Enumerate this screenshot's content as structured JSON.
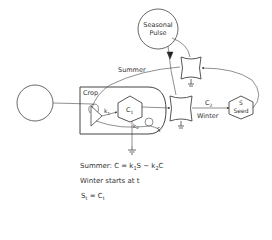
{
  "diagram": {
    "type": "energy-systems-diagram",
    "nodes": {
      "source_left": {
        "shape": "circle",
        "label": ""
      },
      "seasonal_pulse": {
        "shape": "circle",
        "label_line1": "Seasonal",
        "label_line2": "Pulse"
      },
      "crop_box": {
        "shape": "rounded-box",
        "label": "Crop"
      },
      "k1": {
        "shape": "production-triangle",
        "label": "k",
        "sub": "1"
      },
      "c1": {
        "shape": "hexagon-storage",
        "label": "C",
        "sub": "1"
      },
      "k2": {
        "label": "k",
        "sub": "2"
      },
      "s_small": {
        "label": "S"
      },
      "kn": {
        "label": "k"
      },
      "switch_top": {
        "shape": "switch"
      },
      "switch_mid": {
        "shape": "switch"
      },
      "seed": {
        "shape": "hexagon-storage",
        "label_line1": "S",
        "label_line2": "Seed"
      }
    },
    "flow_labels": {
      "summer": "Summer",
      "winter": "Winter",
      "c2": "C",
      "c2_sub": "2"
    },
    "equations": {
      "line1_prefix": "Summer:  C = k",
      "line1_sub1": "1",
      "line1_mid": "S  −  k",
      "line1_sub2": "2",
      "line1_end": "C",
      "line2": "Winter  starts  at  t",
      "line3_a": "S",
      "line3_sub_a": "t",
      "line3_mid": "  =  C",
      "line3_sub_b": "t"
    },
    "colors": {
      "stroke": "#444444",
      "text": "#333333",
      "background": "#ffffff"
    }
  }
}
